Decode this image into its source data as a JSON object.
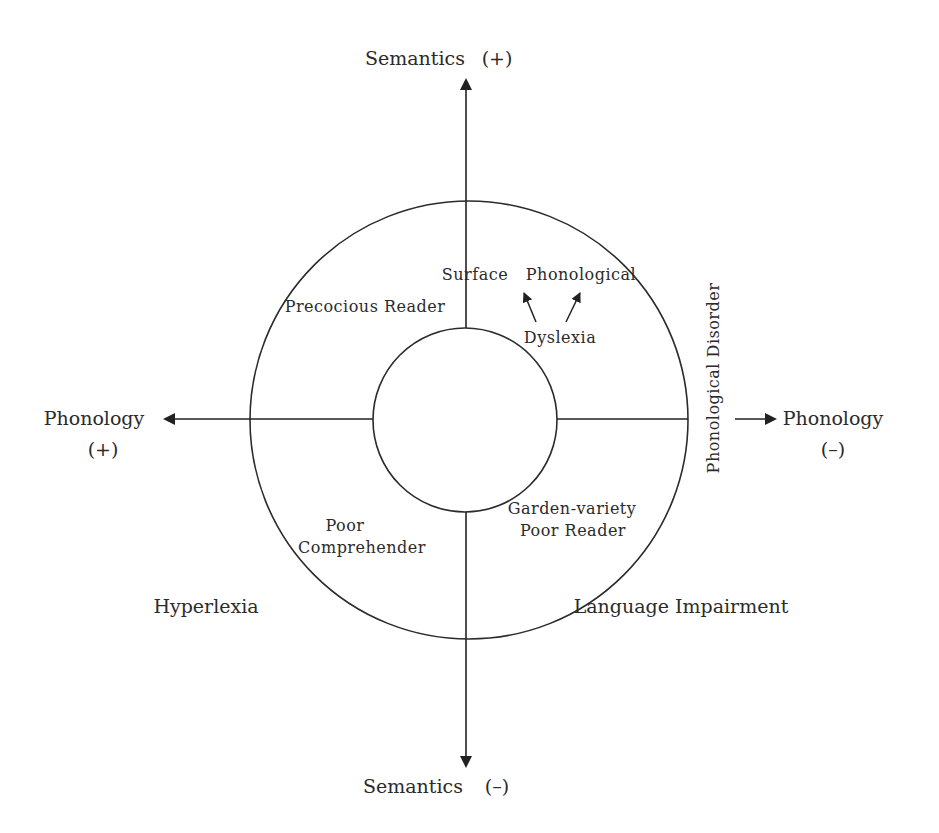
{
  "diagram": {
    "type": "two-axis circular model of reading profiles",
    "axes": {
      "top": {
        "label": "Semantics",
        "sign": "(+)"
      },
      "bottom": {
        "label": "Semantics",
        "sign": "(–)"
      },
      "left": {
        "label": "Phonology",
        "sign": "(+)"
      },
      "right": {
        "label": "Phonology",
        "sign": "(–)"
      }
    },
    "regions": {
      "precocious_reader": "Precocious Reader",
      "surface": "Surface",
      "phonological": "Phonological",
      "dyslexia": "Dyslexia",
      "phonological_disorder": "Phonological Disorder",
      "poor_comprehender_line1": "Poor",
      "poor_comprehender_line2": "Comprehender",
      "garden_variety_line1": "Garden-variety",
      "garden_variety_line2": "Poor Reader",
      "hyperlexia": "Hyperlexia",
      "language_impairment": "Language Impairment"
    },
    "colors": {
      "stroke": "#2b2b2b",
      "background": "#ffffff"
    }
  }
}
